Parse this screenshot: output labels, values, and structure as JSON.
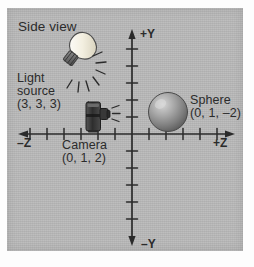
{
  "figure": {
    "title": "Side view",
    "background_color": "#b9b9b9",
    "ink_color": "#2b2b2b"
  },
  "axes": {
    "horizontal": {
      "negative_label": "–Z",
      "positive_label": "+Z",
      "tick_count": 11,
      "tick_spacing_px": 17
    },
    "vertical": {
      "positive_label": "+Y",
      "negative_label": "–Y",
      "tick_count": 12,
      "tick_spacing_px": 17
    },
    "origin_label": "0"
  },
  "objects": [
    {
      "name": "light-source",
      "label_line1": "Light",
      "label_line2": "source",
      "coordinates": "(3, 3, 3)",
      "icon": "lightbulb-icon"
    },
    {
      "name": "camera",
      "label_line1": "Camera",
      "coordinates": "(0, 1, 2)",
      "icon": "camera-icon"
    },
    {
      "name": "sphere",
      "label_line1": "Sphere",
      "coordinates": "(0, 1, –2)",
      "icon": "sphere-icon"
    }
  ],
  "labels": {
    "side_view": "Side view",
    "plus_y": "+Y",
    "minus_y": "–Y",
    "plus_z": "+Z",
    "minus_z": "–Z",
    "light_l1": "Light",
    "light_l2": "source",
    "light_coords": "(3, 3, 3)",
    "camera_l1": "Camera",
    "camera_coords": "(0, 1, 2)",
    "sphere_l1": "Sphere",
    "sphere_coords": "(0, 1, –2)"
  },
  "colors": {
    "panel": "#b9b9b9",
    "ink": "#2b2b2b",
    "bulb_glass": "#f2efe4",
    "bulb_base": "#6e6e6e",
    "camera_body": "#3a3a3a",
    "sphere_light": "#cfcfcf",
    "sphere_dark": "#5e5e5e"
  }
}
